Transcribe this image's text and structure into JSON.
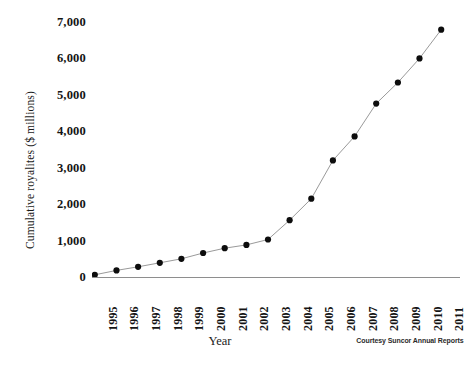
{
  "chart_data": {
    "type": "line",
    "title": "",
    "xlabel": "Year",
    "ylabel": "Cumulative royalites ($ millions)",
    "categories": [
      "1995",
      "1996",
      "1997",
      "1998",
      "1999",
      "2000",
      "2001",
      "2002",
      "2003",
      "2004",
      "2005",
      "2006",
      "2007",
      "2008",
      "2009",
      "2010",
      "2011"
    ],
    "values": [
      60,
      180,
      280,
      390,
      500,
      660,
      790,
      880,
      1030,
      1560,
      2150,
      3200,
      3860,
      4760,
      5340,
      6000,
      6790
    ],
    "series": [
      {
        "name": "Cumulative royalties",
        "values": [
          60,
          180,
          280,
          390,
          500,
          660,
          790,
          880,
          1030,
          1560,
          2150,
          3200,
          3860,
          4760,
          5340,
          6000,
          6790
        ]
      }
    ],
    "ylim": [
      0,
      7000
    ],
    "yticks": [
      0,
      1000,
      2000,
      3000,
      4000,
      5000,
      6000,
      7000
    ],
    "ytick_labels": [
      "0",
      "1,000",
      "2,000",
      "3,000",
      "4,000",
      "5,000",
      "6,000",
      "7,000"
    ],
    "grid": false,
    "legend": "none",
    "marker": "circle",
    "line_color": "#9a9a9a",
    "marker_color": "#0d0d0d"
  },
  "credit": "Courtesy Suncor Annual Reports",
  "axes": {
    "x_title": "Year",
    "y_title": "Cumulative royalites ($ millions)"
  }
}
